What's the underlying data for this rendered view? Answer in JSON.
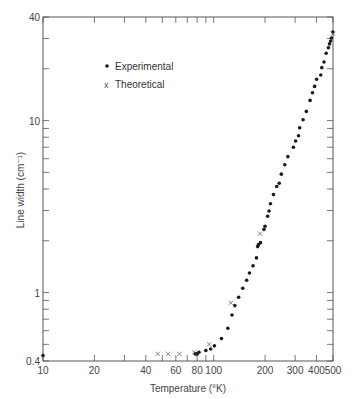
{
  "chart_data": {
    "type": "scatter",
    "title": "",
    "xlabel": "Temperature (°K)",
    "ylabel": "Line width (cm⁻¹)",
    "xscale": "log",
    "yscale": "log",
    "xlim": [
      10,
      500
    ],
    "ylim": [
      0.4,
      40
    ],
    "grid": false,
    "legend_position": "upper-left",
    "x_tick_labels": [
      "10",
      "20",
      "40",
      "60",
      "80",
      "100",
      "200",
      "300",
      "400",
      "500"
    ],
    "x_ticks": [
      10,
      20,
      30,
      40,
      50,
      60,
      70,
      80,
      90,
      100,
      200,
      300,
      400,
      500
    ],
    "y_tick_labels": [
      "0.4",
      "1",
      "10",
      "40"
    ],
    "y_ticks": [
      0.4,
      0.5,
      0.6,
      0.7,
      0.8,
      0.9,
      1,
      2,
      3,
      4,
      5,
      6,
      7,
      8,
      9,
      10,
      20,
      30,
      40
    ],
    "series": [
      {
        "name": "Experimental",
        "marker": "dot",
        "points": [
          [
            10,
            0.43
          ],
          [
            78,
            0.44
          ],
          [
            80,
            0.44
          ],
          [
            82,
            0.45
          ],
          [
            90,
            0.46
          ],
          [
            96,
            0.47
          ],
          [
            101,
            0.49
          ],
          [
            111,
            0.54
          ],
          [
            121,
            0.62
          ],
          [
            128,
            0.74
          ],
          [
            133,
            0.84
          ],
          [
            140,
            0.94
          ],
          [
            148,
            1.06
          ],
          [
            156,
            1.18
          ],
          [
            162,
            1.3
          ],
          [
            170,
            1.43
          ],
          [
            178,
            1.59
          ],
          [
            181,
            1.85
          ],
          [
            183,
            1.9
          ],
          [
            188,
            1.95
          ],
          [
            197,
            2.33
          ],
          [
            200,
            2.43
          ],
          [
            207,
            2.78
          ],
          [
            211,
            2.98
          ],
          [
            215,
            3.28
          ],
          [
            224,
            3.71
          ],
          [
            234,
            4.14
          ],
          [
            242,
            4.32
          ],
          [
            249,
            4.88
          ],
          [
            261,
            5.53
          ],
          [
            272,
            6.17
          ],
          [
            293,
            7.0
          ],
          [
            302,
            7.61
          ],
          [
            314,
            8.16
          ],
          [
            319,
            9.07
          ],
          [
            334,
            10.1
          ],
          [
            349,
            11.3
          ],
          [
            367,
            13.1
          ],
          [
            379,
            14.5
          ],
          [
            390,
            15.8
          ],
          [
            401,
            17.4
          ],
          [
            424,
            18.4
          ],
          [
            430,
            20.3
          ],
          [
            443,
            21.9
          ],
          [
            456,
            24.6
          ],
          [
            470,
            26.5
          ],
          [
            477,
            27.9
          ],
          [
            484,
            29.0
          ],
          [
            490,
            30.2
          ],
          [
            499,
            32.7
          ]
        ]
      },
      {
        "name": "Theoretical",
        "marker": "x",
        "points": [
          [
            47,
            0.44
          ],
          [
            54,
            0.44
          ],
          [
            63,
            0.44
          ],
          [
            77,
            0.45
          ],
          [
            94,
            0.5
          ],
          [
            126,
            0.87
          ],
          [
            187,
            2.2
          ],
          [
            500,
            32.0
          ]
        ]
      }
    ]
  },
  "legend": {
    "items": [
      {
        "label": "Experimental",
        "marker": "dot"
      },
      {
        "label": "Theoretical",
        "marker": "x"
      }
    ]
  },
  "colors": {
    "axis": "#555555",
    "marker": "#1a1a1a",
    "text": "#444444",
    "background": "#ffffff"
  }
}
